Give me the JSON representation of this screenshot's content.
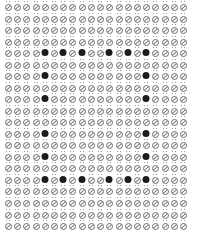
{
  "pattern": {
    "rows": 20,
    "cols": 20,
    "origin_x": 8,
    "origin_y": 5,
    "spacing_x": 9.21,
    "spacing_y": 11.53,
    "glyph": "slashed-circle-with-umlaut",
    "glyph_color": "#6e6e6e",
    "dot_color": "#1c1c1c",
    "background": "#ffffff",
    "filled_cells": [
      [
        4,
        4
      ],
      [
        4,
        6
      ],
      [
        4,
        8
      ],
      [
        4,
        11
      ],
      [
        4,
        13
      ],
      [
        4,
        15
      ],
      [
        6,
        4
      ],
      [
        6,
        15
      ],
      [
        8,
        4
      ],
      [
        8,
        15
      ],
      [
        11,
        4
      ],
      [
        11,
        15
      ],
      [
        13,
        4
      ],
      [
        13,
        15
      ],
      [
        15,
        4
      ],
      [
        15,
        6
      ],
      [
        15,
        8
      ],
      [
        15,
        11
      ],
      [
        15,
        13
      ],
      [
        15,
        15
      ]
    ]
  }
}
